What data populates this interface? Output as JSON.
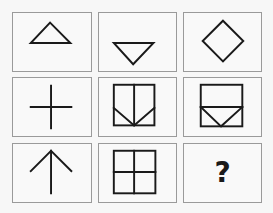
{
  "puzzle": {
    "rows": 3,
    "cols": 3,
    "colors": {
      "background": "#f7f7f7",
      "cell_fill": "#f9f9f9",
      "cell_border": "#9a9a9a",
      "stroke": "#1a1a1a"
    },
    "cells": [
      {
        "row": 1,
        "col": 1,
        "figure": "triangle-up-icon"
      },
      {
        "row": 1,
        "col": 2,
        "figure": "triangle-down-icon"
      },
      {
        "row": 1,
        "col": 3,
        "figure": "diamond-icon"
      },
      {
        "row": 2,
        "col": 1,
        "figure": "plus-cross-icon"
      },
      {
        "row": 2,
        "col": 2,
        "figure": "square-split-vertical-with-v-icon"
      },
      {
        "row": 2,
        "col": 3,
        "figure": "square-split-horizontal-with-v-icon"
      },
      {
        "row": 3,
        "col": 1,
        "figure": "arrow-up-icon"
      },
      {
        "row": 3,
        "col": 2,
        "figure": "square-grid-2x2-icon"
      },
      {
        "row": 3,
        "col": 3,
        "figure": "question-mark",
        "text": "?"
      }
    ]
  }
}
